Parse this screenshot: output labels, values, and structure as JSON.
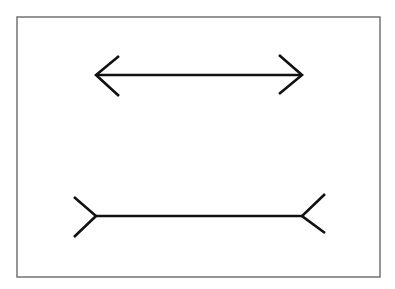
{
  "figure": {
    "title": "",
    "background": "#ffffff",
    "frame_color": "#6a6a6a",
    "line_color": "#111111",
    "frame": {
      "x": 17,
      "y": 17,
      "width": 363,
      "height": 260
    },
    "lines": [
      {
        "name": "inward-arrowheads-line",
        "shaft": {
          "x1": 96,
          "y1": 75,
          "x2": 302,
          "y2": 75
        },
        "left_ends": [
          [
            119,
            56
          ],
          [
            119,
            96
          ]
        ],
        "right_ends": [
          [
            279,
            55
          ],
          [
            279,
            94
          ]
        ],
        "fin_style": "arrowheads-pointing-out"
      },
      {
        "name": "outward-fins-line",
        "shaft": {
          "x1": 96,
          "y1": 216,
          "x2": 302,
          "y2": 216
        },
        "left_ends": [
          [
            74,
            197
          ],
          [
            74,
            237
          ]
        ],
        "right_ends": [
          [
            325,
            194
          ],
          [
            325,
            233
          ]
        ],
        "fin_style": "fins-pointing-out"
      }
    ]
  }
}
